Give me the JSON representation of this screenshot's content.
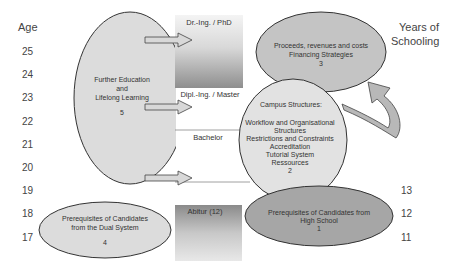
{
  "left_axis": {
    "title": "Age",
    "ticks": [
      "25",
      "24",
      "23",
      "22",
      "21",
      "20",
      "19",
      "18",
      "17"
    ]
  },
  "right_axis": {
    "title_line1": "Years of",
    "title_line2": "Schooling",
    "ticks": [
      "13",
      "12",
      "11"
    ]
  },
  "degrees": {
    "phd": "Dr.-Ing. / PhD",
    "master": "Dipl.-Ing. / Master",
    "bachelor": "Bachelor",
    "abitur": "Abitur (12)"
  },
  "nodes": {
    "further_education": {
      "line1": "Further Education",
      "line2": "and",
      "line3": "Lifelong Learning",
      "number": "5"
    },
    "proceeds": {
      "line1": "Proceeds, revenues and costs",
      "line2": "Financing Strategies",
      "number": "3"
    },
    "campus": {
      "title": "Campus Structures:",
      "line1": "Workflow and Organisational",
      "line2": "Structures",
      "line3": "Restrictions and Constraints",
      "line4": "Accreditation",
      "line5": "Tutorial System",
      "line6": "Ressources",
      "number": "2"
    },
    "high_school": {
      "line1": "Prerequisites of Candidates from",
      "line2": "High School",
      "number": "1"
    },
    "dual_system": {
      "line1": "Prerequisites of Candidates",
      "line2": "from the Dual System",
      "number": "4"
    }
  },
  "colors": {
    "light_fill": "#dcdcdc",
    "mid_fill": "#c4c4c4",
    "dark_fill": "#a6a6a6",
    "outline": "#333333"
  }
}
